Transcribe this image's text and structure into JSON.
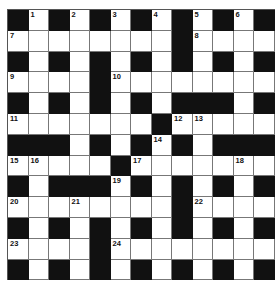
{
  "puzzle": {
    "rows": 13,
    "cols": 13,
    "colors": {
      "black": "#111111",
      "white": "#ffffff",
      "line": "#777777"
    },
    "layout": [
      "B.B.B.B.B.B.B",
      "........B....",
      "B.B.B.B.B.B.B",
      "....B........",
      "B.B.B.B.BBB.B",
      ".......B.....",
      "BBB.B.B.B.BBB",
      ".....B.......",
      "B.BBB.B.B.B.B",
      "........B....",
      "B.B.B.B.B.B.B",
      "....B........",
      "B.B.B.B.B.B.B"
    ],
    "numbers": [
      {
        "r": 0,
        "c": 1,
        "n": "1"
      },
      {
        "r": 0,
        "c": 3,
        "n": "2"
      },
      {
        "r": 0,
        "c": 5,
        "n": "3"
      },
      {
        "r": 0,
        "c": 7,
        "n": "4"
      },
      {
        "r": 0,
        "c": 9,
        "n": "5"
      },
      {
        "r": 0,
        "c": 11,
        "n": "6"
      },
      {
        "r": 1,
        "c": 0,
        "n": "7"
      },
      {
        "r": 1,
        "c": 9,
        "n": "8"
      },
      {
        "r": 3,
        "c": 0,
        "n": "9"
      },
      {
        "r": 3,
        "c": 5,
        "n": "10"
      },
      {
        "r": 5,
        "c": 0,
        "n": "11"
      },
      {
        "r": 5,
        "c": 8,
        "n": "12"
      },
      {
        "r": 5,
        "c": 9,
        "n": "13"
      },
      {
        "r": 6,
        "c": 7,
        "n": "14"
      },
      {
        "r": 7,
        "c": 0,
        "n": "15"
      },
      {
        "r": 7,
        "c": 1,
        "n": "16"
      },
      {
        "r": 7,
        "c": 6,
        "n": "17"
      },
      {
        "r": 7,
        "c": 11,
        "n": "18"
      },
      {
        "r": 8,
        "c": 5,
        "n": "19"
      },
      {
        "r": 9,
        "c": 0,
        "n": "20"
      },
      {
        "r": 9,
        "c": 3,
        "n": "21"
      },
      {
        "r": 9,
        "c": 9,
        "n": "22"
      },
      {
        "r": 11,
        "c": 0,
        "n": "23"
      },
      {
        "r": 11,
        "c": 5,
        "n": "24"
      }
    ]
  }
}
